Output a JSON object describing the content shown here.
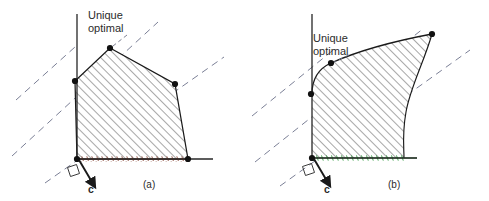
{
  "figure": {
    "background_color": "#ffffff",
    "panels": [
      {
        "id": "a",
        "caption": "(a)",
        "caption_pos": {
          "x": 143,
          "y": 188
        },
        "annotation": {
          "line1": "Unique",
          "line2": "optimal",
          "pos": {
            "x": 88,
            "y": 19
          }
        },
        "gradient_label": "c",
        "gradient_label_pos": {
          "x": 88,
          "y": 193
        },
        "axes": {
          "origin": {
            "x": 77,
            "y": 159
          },
          "y_axis": {
            "x1": 77,
            "y1": 14,
            "x2": 77,
            "y2": 159
          },
          "x_axis": {
            "x1": 77,
            "y1": 159,
            "x2": 213,
            "y2": 159
          },
          "color": "#262626"
        },
        "region_type": "polygon",
        "region_fill": "#ffffff",
        "region_stroke": "#1a1a1a",
        "hatch_color": "#3b3b3b",
        "hatch_angle_deg": 45,
        "vertices": [
          {
            "x": 77,
            "y": 159,
            "marked": true
          },
          {
            "x": 188,
            "y": 159,
            "marked": true
          },
          {
            "x": 175,
            "y": 84,
            "marked": true
          },
          {
            "x": 110,
            "y": 48,
            "marked": true
          },
          {
            "x": 75,
            "y": 81,
            "marked": true
          }
        ],
        "bottom_edge_color": "#8c4b3c",
        "bottom_edge_style": "dotted-hatched",
        "objective_lines": [
          {
            "x1": 16,
            "y1": 100,
            "x2": 75,
            "y2": 47
          },
          {
            "x1": 12,
            "y1": 156,
            "x2": 158,
            "y2": 22
          },
          {
            "x1": 45,
            "y1": 183,
            "x2": 224,
            "y2": 57
          }
        ],
        "objective_line_color": "#7b7f96",
        "gradient_arrow": {
          "x1": 79,
          "y1": 160,
          "x2": 93,
          "y2": 184
        },
        "right_angle_marker": true
      },
      {
        "id": "b",
        "caption": "(b)",
        "caption_pos": {
          "x": 388,
          "y": 188
        },
        "annotation": {
          "line1": "Unique",
          "line2": "optimal",
          "pos": {
            "x": 313,
            "y": 42
          }
        },
        "gradient_label": "c",
        "gradient_label_pos": {
          "x": 324,
          "y": 193
        },
        "axes": {
          "origin": {
            "x": 312,
            "y": 158
          },
          "y_axis": {
            "x1": 312,
            "y1": 14,
            "x2": 312,
            "y2": 158
          },
          "x_axis": {
            "x1": 312,
            "y1": 158,
            "x2": 417,
            "y2": 158
          },
          "color": "#262626"
        },
        "region_type": "curved",
        "region_fill": "#ffffff",
        "region_stroke": "#1a1a1a",
        "hatch_color": "#3b3b3b",
        "hatch_angle_deg": 45,
        "vertices": [
          {
            "x": 312,
            "y": 158,
            "marked": true
          },
          {
            "x": 311,
            "y": 94,
            "marked": true
          },
          {
            "x": 331,
            "y": 63,
            "marked": true
          },
          {
            "x": 432,
            "y": 34,
            "marked": true
          }
        ],
        "bottom_edge_color": "#2f9c3f",
        "bottom_edge_style": "solid-hatched",
        "objective_lines": [
          {
            "x1": 252,
            "y1": 116,
            "x2": 332,
            "y2": 51
          },
          {
            "x1": 255,
            "y1": 162,
            "x2": 424,
            "y2": 28
          },
          {
            "x1": 280,
            "y1": 186,
            "x2": 470,
            "y2": 50
          }
        ],
        "objective_line_color": "#7b7f96",
        "gradient_arrow": {
          "x1": 314,
          "y1": 159,
          "x2": 328,
          "y2": 183
        },
        "right_angle_marker": true
      }
    ]
  }
}
